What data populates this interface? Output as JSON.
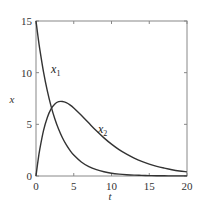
{
  "chart_data": {
    "type": "line",
    "title": "",
    "xlabel": "t",
    "ylabel": "x",
    "xlim": [
      0,
      20
    ],
    "ylim": [
      0,
      15
    ],
    "xticks": [
      0,
      5,
      10,
      15,
      20
    ],
    "yticks": [
      0,
      5,
      10,
      15
    ],
    "xtick_labels": [
      "0",
      "5",
      "10",
      "15",
      "20"
    ],
    "ytick_labels": [
      "0",
      "5",
      "10",
      "15"
    ],
    "grid": false,
    "legend": "none (inline curve labels)",
    "x": [
      0,
      0.25,
      0.5,
      1,
      1.5,
      2,
      2.5,
      3,
      3.5,
      4,
      4.5,
      5,
      6,
      7,
      8,
      9,
      10,
      11,
      12,
      13,
      14,
      15,
      16,
      17,
      18,
      19,
      20
    ],
    "series": [
      {
        "name": "x1",
        "label_main": "x",
        "label_sub": "1",
        "label_pos": [
          2.0,
          10.0
        ],
        "values": [
          15,
          13.57,
          12.28,
          10.05,
          8.23,
          6.74,
          5.52,
          4.52,
          3.7,
          3.03,
          2.48,
          2.03,
          1.36,
          0.91,
          0.61,
          0.41,
          0.27,
          0.18,
          0.12,
          0.08,
          0.06,
          0.04,
          0.02,
          0.02,
          0.01,
          0.01,
          0.01
        ]
      },
      {
        "name": "x2",
        "label_main": "x",
        "label_sub": "2",
        "label_pos": [
          8.2,
          4.2
        ],
        "values": [
          0,
          1.39,
          2.57,
          4.41,
          5.67,
          6.49,
          6.97,
          7.19,
          7.21,
          7.1,
          6.88,
          6.59,
          5.88,
          5.12,
          4.37,
          3.69,
          3.08,
          2.55,
          2.11,
          1.73,
          1.41,
          1.15,
          0.93,
          0.76,
          0.61,
          0.49,
          0.4
        ]
      }
    ],
    "colors": {
      "curve": "#333333",
      "frame": "#888888",
      "text": "#333333"
    }
  }
}
